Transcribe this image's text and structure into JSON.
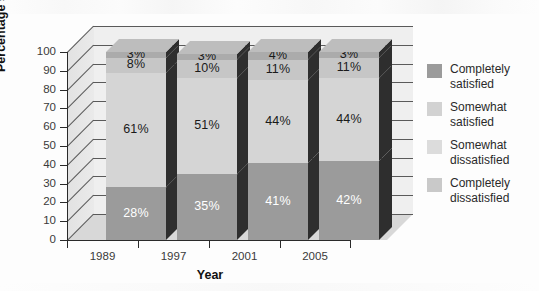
{
  "chart_data": {
    "type": "bar",
    "subtype": "stacked-bar-3d",
    "title": "",
    "xlabel": "Year",
    "ylabel": "Percentage satisfied",
    "categories": [
      "1989",
      "1997",
      "2001",
      "2005"
    ],
    "ylim": [
      0,
      100
    ],
    "yticks": [
      0,
      10,
      20,
      30,
      40,
      50,
      60,
      70,
      80,
      90,
      100
    ],
    "ytick_labels": [
      "0",
      "10",
      "20",
      "30",
      "40",
      "50",
      "60",
      "70",
      "80",
      "90",
      "100"
    ],
    "grid": true,
    "legend_position": "right",
    "stack_order": "bottom-to-top",
    "series": [
      {
        "name": "Completely satisfied",
        "color": "#9b9b9b",
        "values": [
          28,
          35,
          41,
          42
        ],
        "labels": [
          "28%",
          "35%",
          "41%",
          "42%"
        ],
        "label_color": "#ffffff"
      },
      {
        "name": "Somewhat satisfied",
        "color": "#d5d5d5",
        "values": [
          61,
          51,
          44,
          44
        ],
        "labels": [
          "61%",
          "51%",
          "44%",
          "44%"
        ],
        "label_color": "#1a1a1a"
      },
      {
        "name": "Somewhat dissatisfied",
        "color": "#c6c6c6",
        "values": [
          8,
          10,
          11,
          11
        ],
        "labels": [
          "8%",
          "10%",
          "11%",
          "11%"
        ],
        "label_color": "#1a1a1a"
      },
      {
        "name": "Completely dissatisfied",
        "color": "#ababab",
        "values": [
          3,
          3,
          4,
          3
        ],
        "labels": [
          "3%",
          "3%",
          "4%",
          "3%"
        ],
        "label_color": "#1a1a1a"
      }
    ]
  },
  "legend": {
    "items": [
      {
        "label_line1": "Completely",
        "label_line2": "satisfied",
        "color": "#9b9b9b"
      },
      {
        "label_line1": "Somewhat",
        "label_line2": "satisfied",
        "color": "#d2d2d2"
      },
      {
        "label_line1": "Somewhat",
        "label_line2": "dissatisfied",
        "color": "#dcdcdc"
      },
      {
        "label_line1": "Completely",
        "label_line2": "dissatisfied",
        "color": "#c9c9c9"
      }
    ]
  },
  "palette": {
    "background": "#fdfdfd",
    "backwall": "#efefef",
    "floor": "#d8d8d8",
    "sidewall": "#e6e6e6",
    "axis": "#2a2a2a",
    "gridline": "#5a5a5a",
    "bar_side_dark": "#2e2e2e",
    "tick_text": "#3a3a3a",
    "title_text": "#111111"
  }
}
